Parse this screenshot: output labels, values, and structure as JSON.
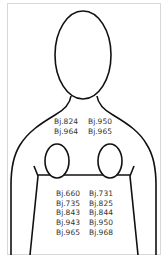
{
  "diagram": {
    "type": "body-silhouette-label-map",
    "upper_labels": {
      "left": [
        "Bj.824",
        "Bj.964"
      ],
      "right": [
        "Bj.950",
        "Bj.965"
      ]
    },
    "torso_labels": {
      "left": [
        "Bj.660",
        "Bj.735",
        "Bj.843",
        "Bj.943",
        "Bj.965"
      ],
      "right": [
        "Bj.731",
        "Bj.825",
        "Bj.844",
        "Bj.950",
        "Bj.968"
      ]
    },
    "colors": {
      "outline": "#111111",
      "text": "#333333",
      "frame": "#d8d8d8"
    }
  }
}
